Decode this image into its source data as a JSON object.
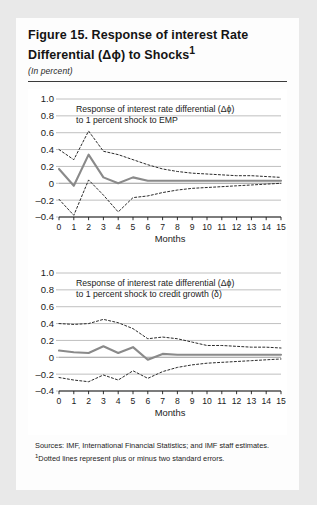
{
  "figure": {
    "title_line1": "Figure 15.  Response of interest Rate",
    "title_line2": "Differential (Δϕ) to Shocks",
    "title_footnote_marker": "1",
    "subtitle": "(In percent)",
    "sources": "Sources: IMF, International Financial Statistics; and IMF staff estimates.",
    "footnote_marker": "1",
    "footnote_text": "Dotted lines represent plus or minus two standard errors."
  },
  "style": {
    "line_color": "#8a8a8a",
    "band_color": "#2b2b2b",
    "grid_color": "#b9b9b9",
    "axis_color": "#1b1b1b",
    "card_bg": "#fdfdfd",
    "page_bg": "#e9e9e9",
    "plot_bg": "#ffffff"
  },
  "chart_data": [
    {
      "id": "emp",
      "type": "line",
      "title": "",
      "legend_line1": "Response of interest rate differential (Δϕ)",
      "legend_line2": "to 1 percent shock to EMP",
      "xlabel": "Months",
      "ylabel": "",
      "ylim": [
        -0.4,
        1.0
      ],
      "yticks": [
        1.0,
        0.8,
        0.6,
        0.4,
        0.2,
        0,
        -0.2,
        -0.4
      ],
      "ytick_labels": [
        "1.0",
        "0.8",
        "0.6",
        "0.4",
        "0.2",
        "0",
        "–0.2",
        "–0.4"
      ],
      "xlim": [
        0,
        15
      ],
      "x": [
        0,
        1,
        2,
        3,
        4,
        5,
        6,
        7,
        8,
        9,
        10,
        11,
        12,
        13,
        14,
        15
      ],
      "xtick_labels": [
        "0",
        "1",
        "2",
        "3",
        "4",
        "5",
        "6",
        "7",
        "8",
        "9",
        "10",
        "11",
        "12",
        "13",
        "14",
        "15"
      ],
      "grid": true,
      "legend_position": "top-left",
      "series": [
        {
          "name": "Response of interest rate differential to 1 percent shock to EMP",
          "style": "solid",
          "values": [
            0.17,
            -0.03,
            0.34,
            0.07,
            0.0,
            0.07,
            0.03,
            0.03,
            0.03,
            0.03,
            0.03,
            0.03,
            0.03,
            0.03,
            0.03,
            0.03
          ]
        },
        {
          "name": "Upper band (+2 standard errors)",
          "style": "dotted",
          "values": [
            0.4,
            0.28,
            0.62,
            0.38,
            0.34,
            0.28,
            0.22,
            0.17,
            0.14,
            0.12,
            0.11,
            0.1,
            0.09,
            0.09,
            0.08,
            0.07
          ]
        },
        {
          "name": "Lower band (–2 standard errors)",
          "style": "dotted",
          "values": [
            -0.19,
            -0.38,
            0.04,
            -0.14,
            -0.34,
            -0.17,
            -0.15,
            -0.11,
            -0.08,
            -0.06,
            -0.05,
            -0.04,
            -0.03,
            -0.02,
            -0.01,
            0.0
          ]
        }
      ]
    },
    {
      "id": "credit",
      "type": "line",
      "title": "",
      "legend_line1": "Response of interest rate differential (Δϕ)",
      "legend_line2": "to 1 percent shock to credit growth (δ)",
      "xlabel": "Months",
      "ylabel": "",
      "ylim": [
        -0.4,
        1.0
      ],
      "yticks": [
        1.0,
        0.8,
        0.6,
        0.4,
        0.2,
        0,
        -0.2,
        -0.4
      ],
      "ytick_labels": [
        "1.0",
        "0.8",
        "0.6",
        "0.4",
        "0.2",
        "0",
        "–0.2",
        "–0.4"
      ],
      "xlim": [
        0,
        15
      ],
      "x": [
        0,
        1,
        2,
        3,
        4,
        5,
        6,
        7,
        8,
        9,
        10,
        11,
        12,
        13,
        14,
        15
      ],
      "xtick_labels": [
        "0",
        "1",
        "2",
        "3",
        "4",
        "5",
        "6",
        "7",
        "8",
        "9",
        "10",
        "11",
        "12",
        "13",
        "14",
        "15"
      ],
      "grid": true,
      "legend_position": "top-left",
      "series": [
        {
          "name": "Response of interest rate differential to 1 percent shock to credit growth",
          "style": "solid",
          "values": [
            0.08,
            0.06,
            0.05,
            0.13,
            0.05,
            0.12,
            -0.03,
            0.04,
            0.03,
            0.03,
            0.03,
            0.03,
            0.03,
            0.03,
            0.03,
            0.03
          ]
        },
        {
          "name": "Upper band (+2 standard errors)",
          "style": "dotted",
          "values": [
            0.4,
            0.39,
            0.4,
            0.45,
            0.41,
            0.34,
            0.22,
            0.24,
            0.22,
            0.18,
            0.14,
            0.14,
            0.13,
            0.12,
            0.12,
            0.11
          ]
        },
        {
          "name": "Lower band (–2 standard errors)",
          "style": "dotted",
          "values": [
            -0.24,
            -0.27,
            -0.29,
            -0.21,
            -0.27,
            -0.16,
            -0.25,
            -0.17,
            -0.12,
            -0.09,
            -0.07,
            -0.06,
            -0.05,
            -0.04,
            -0.03,
            -0.02
          ]
        }
      ]
    }
  ]
}
